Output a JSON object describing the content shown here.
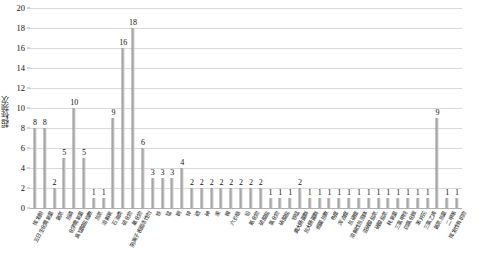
{
  "chart_data": {
    "type": "bar",
    "title": "",
    "xlabel": "",
    "ylabel": "超标频次",
    "ylim": [
      0,
      20
    ],
    "ytick_step": 2,
    "yticks": [
      0,
      2,
      4,
      6,
      8,
      10,
      12,
      14,
      16,
      18,
      20
    ],
    "grid": true,
    "legend": "none",
    "bar_color": "#a6a6a6",
    "categories": [
      "挥发酚",
      "五日生化需氧量",
      "氨氮",
      "总磷",
      "化学需氧量",
      "高锰酸盐指数",
      "总氮",
      "溶解氧",
      "石油类",
      "硫化物",
      "氟化物",
      "阴离子表面活性剂",
      "铁",
      "锰",
      "铜",
      "锌",
      "硒",
      "砷",
      "汞",
      "镉",
      "六价铬",
      "铅",
      "氰化物",
      "硫酸盐",
      "氯化物",
      "硝酸盐",
      "铁锰",
      "粪大肠菌群",
      "总大肠菌群",
      "细菌总数",
      "色度",
      "浑浊度",
      "总硬度",
      "溶解性总固体",
      "亚硝酸盐氮",
      "硝酸盐氮",
      "耗氧量",
      "pH值",
      "水温",
      "透明度",
      "悬浮物",
      "电导率",
      "叶绿素a",
      "藻类密度"
    ],
    "values": [
      8,
      8,
      2,
      5,
      10,
      5,
      1,
      1,
      9,
      6,
      3,
      3,
      4,
      3,
      2,
      2,
      2,
      2,
      2,
      2,
      2,
      2,
      1,
      1,
      2,
      1,
      1,
      1,
      1,
      1,
      1,
      1,
      1,
      1,
      1,
      1,
      1,
      1,
      1,
      9,
      1,
      1,
      1,
      1
    ],
    "data_labels": [
      "8",
      "8",
      "2",
      "5",
      "5",
      "1",
      "1",
      "10",
      "9",
      "16",
      "18",
      "6",
      "3",
      "3",
      "3",
      "4",
      "2",
      "2",
      "2",
      "2",
      "2",
      "2",
      "2",
      "2",
      "1",
      "1",
      "1",
      "2",
      "1",
      "1",
      "1",
      "1",
      "1",
      "1",
      "1",
      "1",
      "1",
      "1",
      "1",
      "1",
      "1",
      "9",
      "1",
      "1",
      "1"
    ],
    "bars": [
      {
        "label": "8",
        "value": 8,
        "category": "挥发酚"
      },
      {
        "label": "8",
        "value": 8,
        "category": "五日生化需氧量"
      },
      {
        "label": "2",
        "value": 2,
        "category": "氨氮"
      },
      {
        "label": "5",
        "value": 5,
        "category": "总磷"
      },
      {
        "label": "10",
        "value": 10,
        "category": "化学需氧量"
      },
      {
        "label": "5",
        "value": 5,
        "category": "高锰酸盐指数"
      },
      {
        "label": "1",
        "value": 1,
        "category": "总氮"
      },
      {
        "label": "1",
        "value": 1,
        "category": "溶解氧"
      },
      {
        "label": "9",
        "value": 9,
        "category": "石油类"
      },
      {
        "label": "16",
        "value": 16,
        "category": "硫化物"
      },
      {
        "label": "18",
        "value": 18,
        "category": "氟化物"
      },
      {
        "label": "6",
        "value": 6,
        "category": "阴离子表面活性剂"
      },
      {
        "label": "3",
        "value": 3,
        "category": "铁"
      },
      {
        "label": "3",
        "value": 3,
        "category": "锰"
      },
      {
        "label": "3",
        "value": 3,
        "category": "铜"
      },
      {
        "label": "4",
        "value": 4,
        "category": "锌"
      },
      {
        "label": "2",
        "value": 2,
        "category": "硒"
      },
      {
        "label": "2",
        "value": 2,
        "category": "砷"
      },
      {
        "label": "2",
        "value": 2,
        "category": "汞"
      },
      {
        "label": "2",
        "value": 2,
        "category": "镉"
      },
      {
        "label": "2",
        "value": 2,
        "category": "六价铬"
      },
      {
        "label": "2",
        "value": 2,
        "category": "铅"
      },
      {
        "label": "2",
        "value": 2,
        "category": "氰化物"
      },
      {
        "label": "2",
        "value": 2,
        "category": "硫酸盐"
      },
      {
        "label": "1",
        "value": 1,
        "category": "氯化物"
      },
      {
        "label": "1",
        "value": 1,
        "category": "硝酸盐"
      },
      {
        "label": "1",
        "value": 1,
        "category": "铁锰"
      },
      {
        "label": "2",
        "value": 2,
        "category": "粪大肠菌群"
      },
      {
        "label": "1",
        "value": 1,
        "category": "总大肠菌群"
      },
      {
        "label": "1",
        "value": 1,
        "category": "细菌总数"
      },
      {
        "label": "1",
        "value": 1,
        "category": "色度"
      },
      {
        "label": "1",
        "value": 1,
        "category": "浑浊度"
      },
      {
        "label": "1",
        "value": 1,
        "category": "总硬度"
      },
      {
        "label": "1",
        "value": 1,
        "category": "溶解性总固体"
      },
      {
        "label": "1",
        "value": 1,
        "category": "亚硝酸盐氮"
      },
      {
        "label": "1",
        "value": 1,
        "category": "硝酸盐氮"
      },
      {
        "label": "1",
        "value": 1,
        "category": "耗氧量"
      },
      {
        "label": "1",
        "value": 1,
        "category": "三氯甲烷"
      },
      {
        "label": "1",
        "value": 1,
        "category": "四氯化碳"
      },
      {
        "label": "1",
        "value": 1,
        "category": "苯并芘"
      },
      {
        "label": "1",
        "value": 1,
        "category": "三氯乙烯"
      },
      {
        "label": "9",
        "value": 9,
        "category": "氨氮总量"
      },
      {
        "label": "1",
        "value": 1,
        "category": "二甲苯"
      },
      {
        "label": "1",
        "value": 1,
        "category": "挥发性有机物"
      }
    ]
  }
}
